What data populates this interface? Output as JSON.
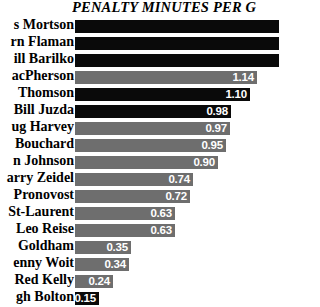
{
  "chart": {
    "title": "PENALTY MINUTES PER G"
  },
  "chart_data": {
    "type": "bar",
    "title": "PENALTY MINUTES PER G",
    "xlabel": "",
    "ylabel": "",
    "orientation": "horizontal",
    "grid": false,
    "legend": null,
    "xlim": [
      0,
      1.28
    ],
    "note": "Top three bars extend past the right edge of the image; their numeric labels are not visible.",
    "categories": [
      "s Mortson",
      "rn Flaman",
      "ill Barilko",
      "acPherson",
      " Thomson",
      "Bill Juzda",
      "ug Harvey",
      " Bouchard",
      "n Johnson",
      "arry Zeidel",
      "Pronovost",
      "St-Laurent",
      "Leo Reise",
      " Goldham",
      "enny Woit",
      "Red Kelly",
      "gh Bolton"
    ],
    "values": [
      1.28,
      1.28,
      1.28,
      1.14,
      1.1,
      0.98,
      0.97,
      0.95,
      0.9,
      0.74,
      0.72,
      0.63,
      0.63,
      0.35,
      0.34,
      0.24,
      0.15
    ],
    "value_labels": [
      "",
      "",
      "",
      "1.14",
      "1.10",
      "0.98",
      "0.97",
      "0.95",
      "0.90",
      "0.74",
      "0.72",
      "0.63",
      "0.63",
      "0.35",
      "0.34",
      "0.24",
      "0.15"
    ],
    "bar_colors": [
      "#0a0a0a",
      "#0a0a0a",
      "#0a0a0a",
      "#6e6e6e",
      "#0a0a0a",
      "#0a0a0a",
      "#6e6e6e",
      "#6e6e6e",
      "#6e6e6e",
      "#6e6e6e",
      "#6e6e6e",
      "#6e6e6e",
      "#6e6e6e",
      "#6e6e6e",
      "#6e6e6e",
      "#6e6e6e",
      "#0a0a0a"
    ],
    "colors": {
      "background": "#ffffff",
      "dark_bar": "#0a0a0a",
      "gray_bar": "#6e6e6e",
      "value_text": "#ffffff",
      "label_text": "#000000"
    }
  }
}
